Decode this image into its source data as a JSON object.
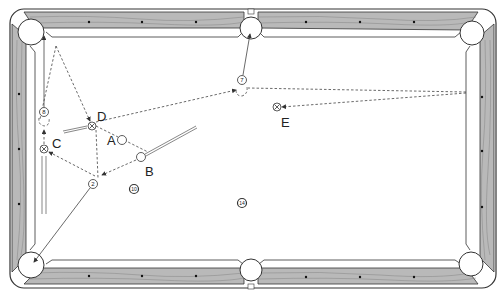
{
  "diagram": {
    "type": "billiards-table-shot-diagram",
    "colors": {
      "rail_wood": "#b9b9b9",
      "rail_outline": "#333333",
      "cloth": "#ffffff",
      "line": "#444444"
    },
    "balls": [
      {
        "id": "7",
        "label": "7",
        "x": 242,
        "y": 80
      },
      {
        "id": "8",
        "label": "8",
        "x": 44,
        "y": 112
      },
      {
        "id": "2",
        "label": "2",
        "x": 93,
        "y": 184
      },
      {
        "id": "10",
        "label": "10",
        "x": 134,
        "y": 189
      },
      {
        "id": "14",
        "label": "14",
        "x": 242,
        "y": 203
      }
    ],
    "cue_balls": [
      {
        "id": "A",
        "label": "A",
        "x": 122,
        "y": 140
      },
      {
        "id": "B",
        "label": "B",
        "x": 140,
        "y": 157
      }
    ],
    "targets": [
      {
        "id": "C",
        "label": "C",
        "x": 44,
        "y": 149
      },
      {
        "id": "D",
        "label": "D",
        "x": 92,
        "y": 126
      },
      {
        "id": "E",
        "label": "E",
        "x": 276,
        "y": 107
      }
    ],
    "labels": {
      "A": "A",
      "B": "B",
      "C": "C",
      "D": "D",
      "E": "E"
    },
    "pockets": [
      "top-left",
      "top-middle",
      "top-right",
      "bottom-left",
      "bottom-middle",
      "bottom-right"
    ]
  }
}
